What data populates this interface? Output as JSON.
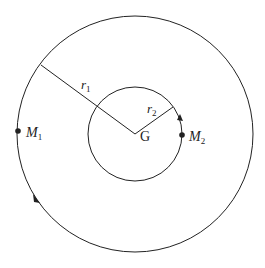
{
  "diagram": {
    "center_label": "G",
    "outer_radius_label": "r",
    "outer_radius_sub": "1",
    "inner_radius_label": "r",
    "inner_radius_sub": "2",
    "mass1_label": "M",
    "mass1_sub": "1",
    "mass2_label": "M",
    "mass2_sub": "2",
    "stroke_color": "#222222"
  }
}
